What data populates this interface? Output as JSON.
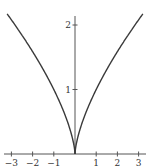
{
  "chart_data": {
    "type": "line",
    "title": "",
    "xlabel": "",
    "ylabel": "",
    "function": "y = x^(2/3)",
    "xlim": [
      -3.35,
      3.4
    ],
    "ylim": [
      0,
      2.15
    ],
    "grid": false,
    "legend": null,
    "x_ticks": [
      -3,
      -2,
      -1,
      1,
      2,
      3
    ],
    "x_tick_labels": [
      "−3",
      "−2",
      "−1",
      "1",
      "2",
      "3"
    ],
    "y_ticks": [
      1,
      2
    ],
    "y_tick_labels": [
      "1",
      "2"
    ],
    "series": [
      {
        "name": "x^(2/3)",
        "x": [
          -3.2,
          -3,
          -2.5,
          -2,
          -1.5,
          -1,
          -0.5,
          -0.25,
          -0.1,
          0,
          0.1,
          0.25,
          0.5,
          1,
          1.5,
          2,
          2.5,
          3,
          3.2
        ],
        "y": [
          2.17,
          2.08,
          1.84,
          1.59,
          1.31,
          1.0,
          0.63,
          0.4,
          0.22,
          0,
          0.22,
          0.4,
          0.63,
          1.0,
          1.31,
          1.59,
          1.84,
          2.08,
          2.17
        ]
      }
    ]
  },
  "colors": {
    "curve": "#3a3a3a",
    "axis": "#555555"
  }
}
